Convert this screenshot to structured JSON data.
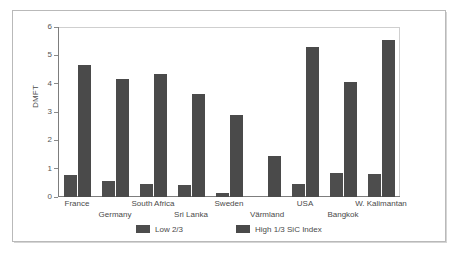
{
  "chart_data": {
    "type": "bar",
    "title": "",
    "xlabel": "",
    "ylabel": "DMFT",
    "ylim": [
      0,
      6
    ],
    "yticks": [
      0,
      1,
      2,
      3,
      4,
      5,
      6
    ],
    "ytick_labels": [
      "0",
      "1",
      "2",
      "3",
      "4",
      "5",
      "6"
    ],
    "grid": false,
    "legend_position": "bottom",
    "categories": [
      "France",
      "Germany",
      "South Africa",
      "Sri Lanka",
      "Sweden",
      "Värmland",
      "USA",
      "Bangkok",
      "W. Kalimantan"
    ],
    "series": [
      {
        "name": "Low 2/3",
        "color": "#4d4d4d",
        "values": [
          0.78,
          0.57,
          0.45,
          0.42,
          0.13,
          0.0,
          0.45,
          0.83,
          0.82
        ]
      },
      {
        "name": "High 1/3 SiC Index",
        "color": "#4a4a4a",
        "values": [
          4.65,
          4.15,
          4.35,
          3.62,
          2.88,
          1.45,
          5.3,
          4.05,
          5.55
        ]
      }
    ]
  },
  "axis": {
    "y_title": "DMFT"
  },
  "legend": {
    "items": [
      {
        "label": "Low 2/3",
        "color": "#4d4d4d"
      },
      {
        "label": "High 1/3 SiC Index",
        "color": "#4a4a4a"
      }
    ]
  },
  "colors": {
    "bar": "#4a4a4a",
    "axis": "#7d7d7d",
    "frame": "#b9b9b9",
    "text": "#4a4a4a",
    "background": "#ffffff"
  }
}
